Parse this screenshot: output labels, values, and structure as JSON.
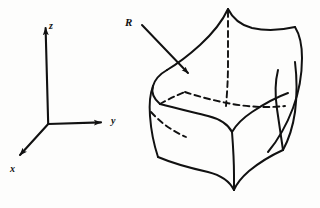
{
  "figure": {
    "kind": "line-drawing",
    "background_color": "#fdfdfc",
    "ink_color": "#111111",
    "width": 320,
    "height": 208
  },
  "axes": {
    "origin": {
      "x": 48,
      "y": 124
    },
    "labels": {
      "z": "z",
      "y": "y",
      "x": "x"
    },
    "z_axis": {
      "from": {
        "x": 48,
        "y": 124
      },
      "to": {
        "x": 45,
        "y": 22
      },
      "arrow": true
    },
    "y_axis": {
      "from": {
        "x": 48,
        "y": 124
      },
      "to": {
        "x": 108,
        "y": 122
      },
      "arrow": true
    },
    "x_axis": {
      "from": {
        "x": 48,
        "y": 124
      },
      "to": {
        "x": 15,
        "y": 160
      },
      "arrow": true
    }
  },
  "region": {
    "label": "R",
    "label_position": {
      "x": 125,
      "y": 17
    },
    "pointer": {
      "from": {
        "x": 141,
        "y": 24
      },
      "to": {
        "x": 193,
        "y": 78
      },
      "arrow": true
    },
    "description": "Curvilinear solid bounded by curved faces, visible edges solid, hidden edges dashed",
    "visible_edge_style": "solid",
    "hidden_edge_style": "dashed"
  },
  "icons": {
    "arrowhead": "arrowhead-icon"
  }
}
